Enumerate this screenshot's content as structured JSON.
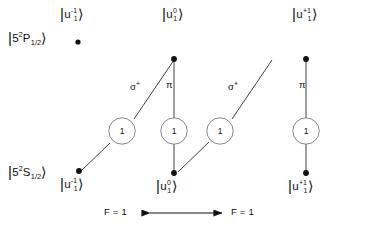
{
  "figure": {
    "type": "atomic-transition-level-diagram",
    "background_color": "#ffffff",
    "ink_color": "#111111"
  },
  "levels": {
    "upper": {
      "name": "excited-state-level",
      "term_prefix": "5",
      "term_multiplicity": "2",
      "term_letter": "P",
      "term_j": "1/2",
      "label_text": "|5 2P1/2>"
    },
    "lower": {
      "name": "ground-state-level",
      "term_prefix": "5",
      "term_multiplicity": "2",
      "term_letter": "S",
      "term_j": "1/2",
      "label_text": "|5 2S1/2>"
    }
  },
  "states": {
    "upper": [
      {
        "id": "upper-minus",
        "base": "u",
        "sup": "-1",
        "sub": "1",
        "x": 70,
        "y": 45
      },
      {
        "id": "upper-zero",
        "base": "u",
        "sup": "0",
        "sub": "1",
        "x": 192,
        "y": 45
      },
      {
        "id": "upper-plus",
        "base": "u",
        "sup": "+1",
        "sub": "1",
        "x": 325,
        "y": 45
      }
    ],
    "lower": [
      {
        "id": "lower-minus",
        "base": "u",
        "sup": "-1",
        "sub": "1",
        "x": 70,
        "y": 180
      },
      {
        "id": "lower-zero",
        "base": "u",
        "sup": "0",
        "sub": "1",
        "x": 192,
        "y": 180
      },
      {
        "id": "lower-plus",
        "base": "u",
        "sup": "+1",
        "sub": "1",
        "x": 325,
        "y": 180
      }
    ]
  },
  "transitions": [
    {
      "id": "t1",
      "polarization": "sigma",
      "pol_sup": "+",
      "coefficient": "1",
      "from": "lower-minus",
      "to": "upper-zero"
    },
    {
      "id": "t2",
      "polarization": "pi",
      "pol_sup": "",
      "coefficient": "1",
      "from": "lower-zero",
      "to": "upper-zero"
    },
    {
      "id": "t3",
      "polarization": "sigma",
      "pol_sup": "+",
      "coefficient": "1",
      "from": "lower-zero",
      "to": "upper-plus"
    },
    {
      "id": "t4",
      "polarization": "pi",
      "pol_sup": "",
      "coefficient": "1",
      "from": "lower-plus",
      "to": "upper-plus"
    }
  ],
  "polarization_labels": {
    "sigma_glyph": "σ",
    "sigma_sup": "+",
    "pi_glyph": "π"
  },
  "coefficients": {
    "circle_1": "1",
    "circle_2": "1",
    "circle_3": "1",
    "circle_4": "1"
  },
  "footer": {
    "left_label": "F = 1",
    "right_label": "F = 1",
    "arrow": "double-headed"
  },
  "ket_glyphs": {
    "bar": "|",
    "angle": "〉"
  }
}
